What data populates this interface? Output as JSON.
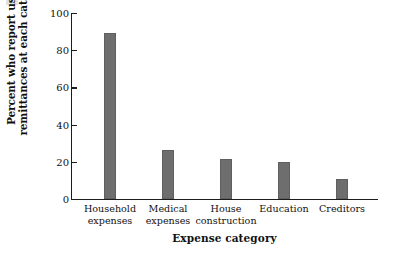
{
  "chart_data": {
    "type": "bar",
    "title": "",
    "xlabel": "Expense category",
    "ylabel": "Percent who report using\nremittances at each category",
    "categories": [
      "Household expenses",
      "Medical expenses",
      "House construction",
      "Education",
      "Creditors"
    ],
    "category_lines": [
      "Household\nexpenses",
      "Medical\nexpenses",
      "House\nconstruction",
      "Education",
      "Creditors"
    ],
    "values": [
      89,
      26.5,
      21.5,
      20,
      11
    ],
    "ylim": [
      0,
      100
    ],
    "yticks": [
      0,
      20,
      40,
      60,
      80,
      100
    ],
    "ytick_labels": [
      "0",
      "20",
      "40",
      "60",
      "80",
      "100"
    ],
    "grid": false,
    "legend": false,
    "bar_color": "#6e6e6e",
    "axis_color": "#1c1c1c"
  },
  "axis": {
    "y_title": "Percent who report using\nremittances at each category",
    "x_title": "Expense category"
  }
}
